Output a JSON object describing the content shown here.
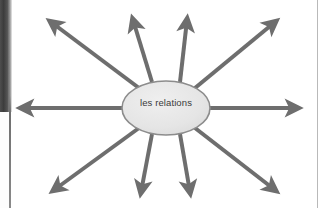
{
  "document": {
    "type": "scanned-worksheet-figure",
    "page_edge": {
      "left_gutter_shadow": "#3c3c3c",
      "left_rule": "#6f6f6f",
      "right_rule": "#b9b9b9"
    }
  },
  "diagram": {
    "kind": "radial-spider-diagram",
    "center_node": {
      "label": "les relations",
      "shape": "ellipse",
      "fill": "#e6e6e6",
      "stroke": "#8c8c8c",
      "text_color": "#3a3a3a",
      "cx": 166,
      "cy": 108,
      "rx": 44,
      "ry": 27
    },
    "arrow_style": {
      "color": "#6e6e6e",
      "stroke_width": 4,
      "head": "solid-triangle"
    },
    "arrow_count": 10,
    "arrows": [
      {
        "name": "arrow-west",
        "direction": "west",
        "angle_deg": 180,
        "tip_x": 16,
        "tip_y": 108
      },
      {
        "name": "arrow-northwest",
        "direction": "northwest",
        "angle_deg": 143,
        "tip_x": 45,
        "tip_y": 16
      },
      {
        "name": "arrow-north-left",
        "direction": "north-left",
        "angle_deg": 100,
        "tip_x": 131,
        "tip_y": 13
      },
      {
        "name": "arrow-north-right",
        "direction": "north-right",
        "angle_deg": 78,
        "tip_x": 189,
        "tip_y": 13
      },
      {
        "name": "arrow-northeast",
        "direction": "northeast",
        "angle_deg": 38,
        "tip_x": 281,
        "tip_y": 16
      },
      {
        "name": "arrow-east",
        "direction": "east",
        "angle_deg": 0,
        "tip_x": 303,
        "tip_y": 108
      },
      {
        "name": "arrow-southeast",
        "direction": "southeast",
        "angle_deg": -38,
        "tip_x": 281,
        "tip_y": 196
      },
      {
        "name": "arrow-south-right",
        "direction": "south-right",
        "angle_deg": -78,
        "tip_x": 192,
        "tip_y": 198
      },
      {
        "name": "arrow-south-left",
        "direction": "south-left",
        "angle_deg": -100,
        "tip_x": 139,
        "tip_y": 198
      },
      {
        "name": "arrow-southwest",
        "direction": "southwest",
        "angle_deg": -143,
        "tip_x": 48,
        "tip_y": 196
      }
    ]
  }
}
